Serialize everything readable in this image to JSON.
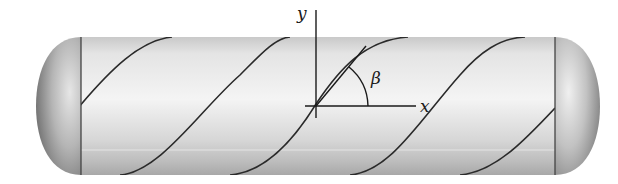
{
  "diagram": {
    "labels": {
      "y_axis": "y",
      "x_axis": "x",
      "angle": "β"
    },
    "colors": {
      "line": "#222222",
      "vessel_light": "#f2f2f2",
      "vessel_dark": "#8a8a8a",
      "background": "#ffffff"
    }
  }
}
